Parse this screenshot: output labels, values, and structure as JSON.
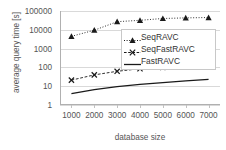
{
  "chart_data": {
    "type": "line",
    "title": "",
    "xlabel": "database size",
    "ylabel": "average query time [s]",
    "x": [
      1000,
      2000,
      3000,
      4000,
      5000,
      6000,
      7000
    ],
    "xticklabels": [
      "1000",
      "2000",
      "3000",
      "4000",
      "5000",
      "6000",
      "7000"
    ],
    "yticklabels": [
      "1",
      "10",
      "100",
      "1000",
      "10000",
      "100000"
    ],
    "yticks": [
      1,
      10,
      100,
      1000,
      10000,
      100000
    ],
    "yscale": "log",
    "ylim": [
      1,
      100000
    ],
    "xlim": [
      500,
      7500
    ],
    "grid": "horizontal",
    "legend_position": "upper-right-inside",
    "series": [
      {
        "name": "SeqRAVC",
        "values": [
          4500,
          9500,
          27000,
          32000,
          40000,
          43000,
          45000
        ],
        "marker": "triangle",
        "linestyle": "dotted",
        "color": "#1a1a1a"
      },
      {
        "name": "SeqFastRAVC",
        "values": [
          21,
          40,
          62,
          85,
          100,
          110,
          128
        ],
        "marker": "x",
        "linestyle": "dashed",
        "color": "#1a1a1a"
      },
      {
        "name": "FastRAVC",
        "values": [
          4.0,
          6.5,
          9.5,
          12.5,
          15.5,
          19.0,
          23.0
        ],
        "marker": "none",
        "linestyle": "solid",
        "color": "#1a1a1a"
      }
    ]
  },
  "legend": {
    "items": [
      {
        "label": "SeqRAVC"
      },
      {
        "label": "SeqFastRAVC"
      },
      {
        "label": "FastRAVC"
      }
    ]
  }
}
